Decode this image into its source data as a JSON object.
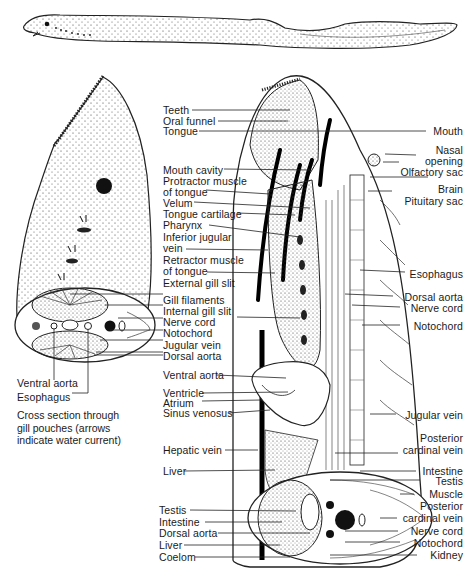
{
  "figure": {
    "top_view": "lamprey-whole-body-lateral",
    "caption": "Cross section through\ngill pouches (arrows\nindicate water current)"
  },
  "cross_section_gill": {
    "labels": [
      "Ventral aorta",
      "Esophagus"
    ]
  },
  "sagittal_left_labels": [
    "Teeth",
    "Oral funnel",
    "Tongue",
    "Mouth cavity",
    "Protractor muscle",
    "of tongue",
    "Velum",
    "Tongue cartilage",
    "Pharynx",
    "Inferior jugular",
    "vein",
    "Retractor muscle",
    "of tongue",
    "External gill slit",
    "Gill filaments",
    "Internal gill slit",
    "Nerve cord",
    "Notochord",
    "Jugular vein",
    "Dorsal aorta",
    "Ventral aorta",
    "Ventricle",
    "Atrium",
    "Sinus venosus",
    "Hepatic vein",
    "Liver"
  ],
  "sagittal_right_labels": [
    "Mouth",
    "Nasal",
    "opening",
    "Olfactory sac",
    "Brain",
    "Pituitary sac",
    "Esophagus",
    "Dorsal aorta",
    "Nerve cord",
    "Notochord",
    "Jugular vein",
    "Posterior",
    "cardinal vein",
    "Intestine",
    "Testis",
    "Muscle",
    "Posterior",
    "cardinal vein",
    "Nerve cord",
    "Notochord",
    "Kidney"
  ],
  "cross_section_body_labels": [
    "Testis",
    "Intestine",
    "Dorsal aorta",
    "Liver",
    "Coelom"
  ]
}
